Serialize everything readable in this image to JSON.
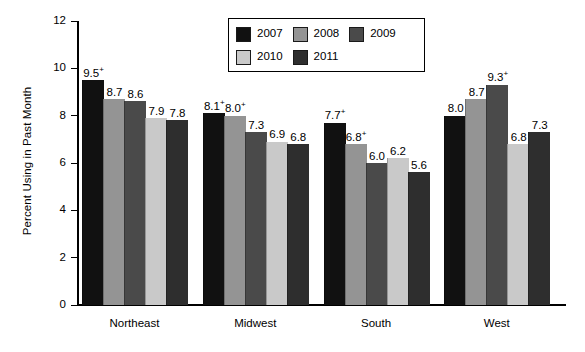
{
  "chart_data": {
    "type": "bar",
    "title": "",
    "subtitle": "",
    "xlabel": "",
    "ylabel": "Percent Using in Past Month",
    "ylim": [
      0,
      12
    ],
    "yticks": [
      0,
      2,
      4,
      6,
      8,
      10,
      12
    ],
    "ytick_labels": [
      "0",
      "2",
      "4",
      "6",
      "8",
      "10",
      "12"
    ],
    "grid": false,
    "legend_position": "top-center",
    "categories": [
      "Northeast",
      "Midwest",
      "South",
      "West"
    ],
    "series": [
      {
        "name": "2007",
        "color": "#111111",
        "values": [
          9.5,
          8.1,
          7.7,
          8.0
        ],
        "labels": [
          "9.5",
          "8.1",
          "7.7",
          "8.0"
        ],
        "annotations": [
          "+",
          "+",
          "+",
          ""
        ]
      },
      {
        "name": "2008",
        "color": "#949494",
        "values": [
          8.7,
          8.0,
          6.8,
          8.7
        ],
        "labels": [
          "8.7",
          "8.0",
          "6.8",
          "8.7"
        ],
        "annotations": [
          "",
          "+",
          "+",
          ""
        ]
      },
      {
        "name": "2009",
        "color": "#4a4a4a",
        "values": [
          8.6,
          7.3,
          6.0,
          9.3
        ],
        "labels": [
          "8.6",
          "7.3",
          "6.0",
          "9.3"
        ],
        "annotations": [
          "",
          "",
          "",
          "+"
        ]
      },
      {
        "name": "2010",
        "color": "#c9c9c9",
        "values": [
          7.9,
          6.9,
          6.2,
          6.8
        ],
        "labels": [
          "7.9",
          "6.9",
          "6.2",
          "6.8"
        ],
        "annotations": [
          "",
          "",
          "",
          ""
        ]
      },
      {
        "name": "2011",
        "color": "#2e2e2e",
        "values": [
          7.8,
          6.8,
          5.6,
          7.3
        ],
        "labels": [
          "7.8",
          "6.8",
          "5.6",
          "7.3"
        ],
        "annotations": [
          "",
          "",
          "",
          ""
        ]
      }
    ]
  },
  "legend": {
    "rows": [
      [
        {
          "label": "2007",
          "color": "#111111"
        },
        {
          "label": "2008",
          "color": "#949494"
        },
        {
          "label": "2009",
          "color": "#4a4a4a"
        }
      ],
      [
        {
          "label": "2010",
          "color": "#c9c9c9"
        },
        {
          "label": "2011",
          "color": "#2e2e2e"
        }
      ]
    ]
  }
}
